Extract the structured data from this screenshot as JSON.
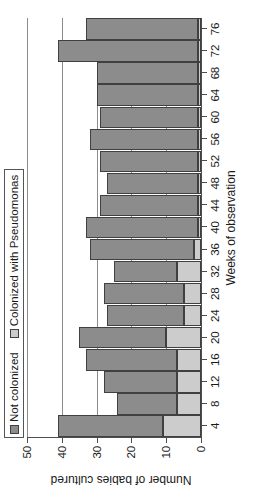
{
  "chart_data": {
    "type": "bar",
    "subtype": "stacked-bar",
    "orientation": "vertical",
    "title": "",
    "xlabel": "Weeks of observation",
    "ylabel": "Number of babies cultured",
    "ylim": [
      0,
      50
    ],
    "ytick_labels": [
      "0",
      "10",
      "20",
      "30",
      "40",
      "50"
    ],
    "ytick_values": [
      0,
      10,
      20,
      30,
      40,
      50
    ],
    "grid": true,
    "grid_axis": "y",
    "legend_position": "top-left",
    "categories": [
      4,
      8,
      12,
      16,
      20,
      24,
      28,
      32,
      36,
      40,
      44,
      48,
      52,
      56,
      60,
      64,
      68,
      72,
      76
    ],
    "xtick_labels": [
      "4",
      "8",
      "12",
      "16",
      "20",
      "24",
      "28",
      "32",
      "36",
      "40",
      "44",
      "48",
      "52",
      "56",
      "60",
      "64",
      "68",
      "72",
      "76"
    ],
    "series": [
      {
        "name": "Colonized with Pseudomonas",
        "color": "#cccccc",
        "values": [
          11,
          7,
          7,
          7,
          10,
          5,
          5,
          7,
          2,
          1,
          1,
          1,
          1,
          1,
          1,
          1,
          1,
          1,
          1
        ]
      },
      {
        "name": "Not colonized",
        "color": "#8c8c8c",
        "values": [
          30,
          17,
          21,
          26,
          25,
          22,
          23,
          18,
          30,
          32,
          28,
          26,
          28,
          31,
          28,
          29,
          29,
          40,
          32
        ]
      }
    ],
    "totals": [
      41,
      24,
      28,
      33,
      35,
      27,
      28,
      25,
      32,
      33,
      29,
      27,
      29,
      32,
      29,
      30,
      30,
      41,
      33
    ]
  },
  "legend": {
    "items": [
      {
        "label": "Not colonized",
        "swatch": "dark"
      },
      {
        "label": "Colonized with Pseudomonas",
        "swatch": "light"
      }
    ]
  },
  "axes": {
    "x_title": "Weeks of observation",
    "y_title": "Number of babies cultured"
  }
}
